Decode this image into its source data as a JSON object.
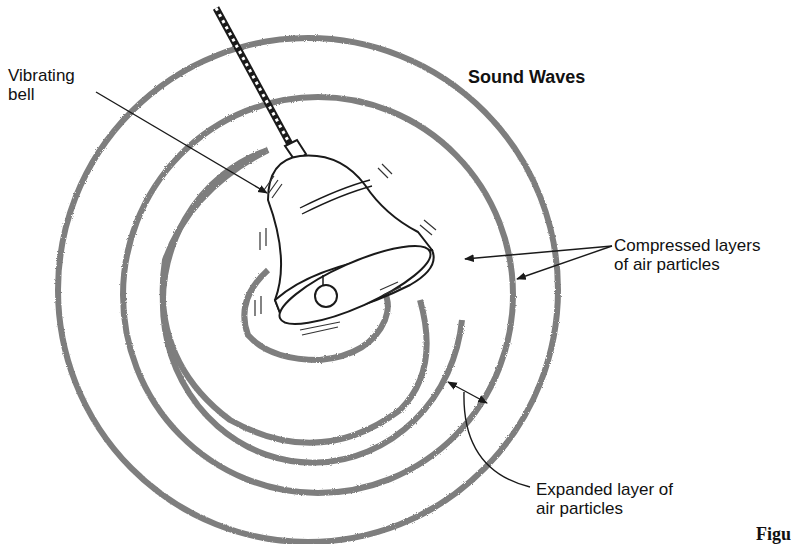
{
  "figure": {
    "title": "Sound Waves",
    "labels": {
      "bell": "Vibrating\nbell",
      "compressed": "Compressed layers\nof air particles",
      "expanded": "Expanded layer of\nair particles"
    },
    "caption_fragment": "Figu"
  },
  "colors": {
    "ring": "#7a7a7a",
    "line": "#1a1a1a",
    "background": "#ffffff"
  }
}
